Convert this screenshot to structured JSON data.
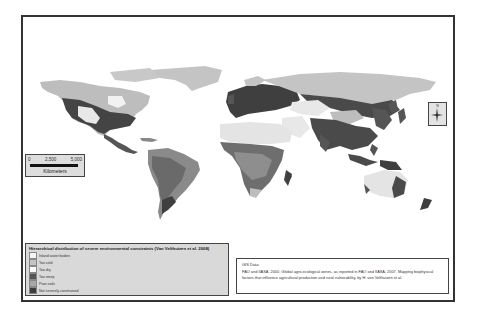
{
  "map": {
    "title": "Hierarchical distribution of severe environmental constraints (Van Velthuizen et al. 2008)",
    "colors": {
      "inland_water": "#f2f2f2",
      "too_cold": "#bdbdbd",
      "too_dry": "#e8e8e8",
      "too_steep": "#4d4d4d",
      "poor_soils": "#9a9a9a",
      "not_constrained": "#3a3a3a",
      "frame": "#333333",
      "panel_bg": "#d9d9d9"
    }
  },
  "scale_bar": {
    "ticks": [
      "0",
      "2,500",
      "5,000"
    ],
    "unit": "Kilometers"
  },
  "north_arrow": {
    "label": "N"
  },
  "legend": {
    "title": "Hierarchical distribution of severe environmental constraints (Van Velthuizen et al. 2008)",
    "items": [
      {
        "label": "Inland water bodies",
        "color": "#f4f4f4"
      },
      {
        "label": "Too cold",
        "color": "#c4c4c4"
      },
      {
        "label": "Too dry",
        "color": "#ffffff"
      },
      {
        "label": "Too steep",
        "color": "#555555"
      },
      {
        "label": "Poor soils",
        "color": "#a8a8a8"
      },
      {
        "label": "Not severely constrained",
        "color": "#3c3c3c"
      }
    ]
  },
  "citation": {
    "heading": "GIS Data:",
    "text": "FAO and IIASA. 2000. Global agro-ecological zones, as reported in FAO and IIASA, 2007. Mapping biophysical factors that influence agricultural production and rural vulnerability, by H. von Velthuizen et al."
  }
}
